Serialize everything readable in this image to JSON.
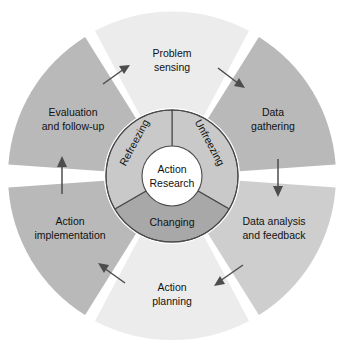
{
  "diagram": {
    "center_hub": {
      "line1": "Action",
      "line2": "Research"
    },
    "inner_ring": {
      "segments": [
        {
          "id": "unfreezing",
          "label": "Unfreezing",
          "color": "#c9c9c9",
          "start_deg": 0,
          "end_deg": 120
        },
        {
          "id": "changing",
          "label": "Changing",
          "color": "#a8a8a8",
          "start_deg": 120,
          "end_deg": 240
        },
        {
          "id": "refreezing",
          "label": "Refreezing",
          "color": "#c9c9c9",
          "start_deg": 240,
          "end_deg": 360
        }
      ]
    },
    "outer_ring": {
      "segments": [
        {
          "id": "problem-sensing",
          "line1": "Problem",
          "line2": "sensing",
          "color": "#ececec"
        },
        {
          "id": "data-gathering",
          "line1": "Data",
          "line2": "gathering",
          "color": "#b9b9b9"
        },
        {
          "id": "data-analysis-and-feedback",
          "line1": "Data analysis",
          "line2": "and feedback",
          "color": "#cecece"
        },
        {
          "id": "action-planning",
          "line1": "Action",
          "line2": "planning",
          "color": "#ececec"
        },
        {
          "id": "action-implementation",
          "line1": "Action",
          "line2": "implementation",
          "color": "#b9b9b9"
        },
        {
          "id": "evaluation-and-follow-up",
          "line1": "Evaluation",
          "line2": "and follow-up",
          "color": "#b9b9b9"
        }
      ]
    },
    "arrows": [
      {
        "id": "arrow-to-problem-sensing",
        "direction": "clockwise"
      },
      {
        "id": "arrow-to-data-gathering",
        "direction": "clockwise"
      },
      {
        "id": "arrow-to-data-analysis",
        "direction": "clockwise"
      },
      {
        "id": "arrow-to-action-planning",
        "direction": "clockwise"
      },
      {
        "id": "arrow-to-action-implementation",
        "direction": "clockwise"
      },
      {
        "id": "arrow-to-evaluation",
        "direction": "clockwise"
      }
    ],
    "colors": {
      "background": "#ffffff",
      "outline": "#4a4a4a",
      "arrow": "#4d4d4d",
      "text": "#111111"
    }
  }
}
